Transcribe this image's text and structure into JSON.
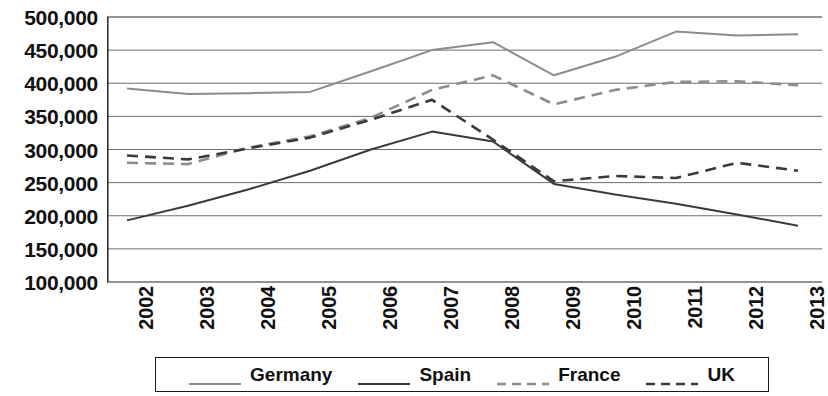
{
  "chart_data": {
    "type": "line",
    "title": "",
    "xlabel": "",
    "ylabel": "",
    "x": [
      "2002",
      "2003",
      "2004",
      "2005",
      "2006",
      "2007",
      "2008",
      "2009",
      "2010",
      "2011",
      "2012",
      "2013"
    ],
    "categories": [
      "2002",
      "2003",
      "2004",
      "2005",
      "2006",
      "2007",
      "2008",
      "2009",
      "2010",
      "2011",
      "2012",
      "2013"
    ],
    "ylim": [
      100000,
      500000
    ],
    "ytick_values": [
      500000,
      450000,
      400000,
      350000,
      300000,
      250000,
      200000,
      150000,
      100000
    ],
    "ytick_labels": [
      "500,000",
      "450,000",
      "400,000",
      "350,000",
      "300,000",
      "250,000",
      "200,000",
      "150,000",
      "100,000"
    ],
    "grid": true,
    "legend_position": "bottom",
    "series": [
      {
        "name": "Germany",
        "color": "#8c8c8c",
        "style": "solid",
        "values": [
          392000,
          384000,
          385000,
          387000,
          418000,
          450000,
          462000,
          412000,
          440000,
          478000,
          472000,
          474000
        ]
      },
      {
        "name": "Spain",
        "color": "#3a3a3a",
        "style": "solid",
        "values": [
          193000,
          215000,
          240000,
          268000,
          300000,
          327000,
          312000,
          248000,
          232000,
          218000,
          202000,
          185000
        ]
      },
      {
        "name": "France",
        "color": "#8c8c8c",
        "style": "dashed",
        "values": [
          280000,
          278000,
          303000,
          320000,
          348000,
          390000,
          412000,
          368000,
          390000,
          402000,
          403000,
          397000
        ]
      },
      {
        "name": "UK",
        "color": "#3a3a3a",
        "style": "dashed",
        "values": [
          291000,
          285000,
          302000,
          318000,
          345000,
          375000,
          315000,
          252000,
          260000,
          257000,
          280000,
          268000
        ]
      }
    ]
  },
  "legend": {
    "items": [
      {
        "label": "Germany"
      },
      {
        "label": "Spain"
      },
      {
        "label": "France"
      },
      {
        "label": "UK"
      }
    ]
  }
}
